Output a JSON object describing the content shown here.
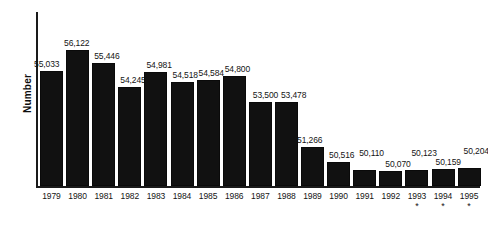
{
  "chart_data": {
    "type": "bar",
    "title": "",
    "subtitle": "",
    "xlabel": "",
    "ylabel": "Number",
    "grid": false,
    "legend": null,
    "axis_note": "Y axis is zero-suppressed (truncated); bar baseline corresponds to approximately 49,300.",
    "ylim": [
      49300,
      56600
    ],
    "categories": [
      "1979",
      "1980",
      "1981",
      "1982",
      "1983",
      "1984",
      "1985",
      "1986",
      "1987",
      "1988",
      "1989",
      "1990",
      "1991",
      "1992",
      "1993",
      "1994",
      "1995"
    ],
    "values": [
      55033,
      56122,
      55446,
      54245,
      54981,
      54518,
      54584,
      54800,
      53500,
      53478,
      51266,
      50516,
      50110,
      50070,
      50123,
      50159,
      50204
    ],
    "value_labels": [
      "55,033",
      "56,122",
      "55,446",
      "54,245",
      "54,981",
      "54,518",
      "54,584",
      "54,800",
      "53,500",
      "53,478",
      "51,266",
      "50,516",
      "50,110",
      "50,070",
      "50,123",
      "50,159",
      "50,204"
    ],
    "footnote_markers": {
      "1993": "*",
      "1994": "*",
      "1995": "*"
    },
    "colors": {
      "bar": "#111111",
      "axis": "#1a1a1a",
      "text": "#141414",
      "background": "#ffffff"
    }
  },
  "axis": {
    "y_title": "Number"
  }
}
